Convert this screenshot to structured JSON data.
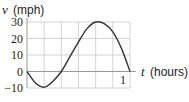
{
  "chart_data": {
    "type": "line",
    "title": "",
    "xlabel": "t (hours)",
    "ylabel": "v (mph)",
    "xlabel_var": "t",
    "xlabel_unit": "(hours)",
    "ylabel_var": "v",
    "ylabel_unit": "(mph)",
    "xlim": [
      0,
      1
    ],
    "ylim": [
      -10,
      30
    ],
    "x_ticks": [
      {
        "value": 1,
        "label": "1"
      }
    ],
    "y_ticks": [
      {
        "value": 30,
        "label": "30"
      },
      {
        "value": 20,
        "label": "20"
      },
      {
        "value": 10,
        "label": "10"
      },
      {
        "value": 0,
        "label": "0"
      },
      {
        "value": -10,
        "label": "−10"
      }
    ],
    "grid": true,
    "x_grid_step": 0.1667,
    "y_grid_step": 10,
    "legend": null,
    "series": [
      {
        "name": "v(t)",
        "x": [
          0,
          0.083,
          0.167,
          0.25,
          0.333,
          0.417,
          0.5,
          0.583,
          0.667,
          0.75,
          0.833,
          0.917,
          1.0
        ],
        "values": [
          0,
          -7,
          -9.5,
          -6,
          0,
          9,
          18,
          26,
          30,
          29,
          24,
          14,
          0
        ]
      }
    ]
  }
}
